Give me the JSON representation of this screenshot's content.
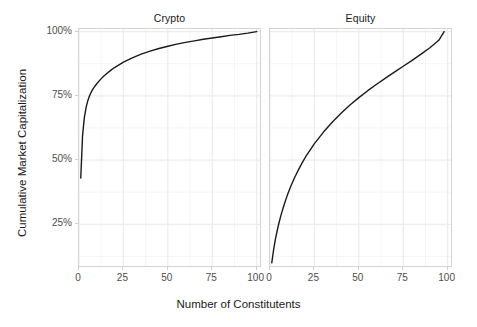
{
  "figure": {
    "width": 477,
    "height": 327,
    "background": "#ffffff",
    "line_color": "#1a1a1a",
    "grid_color": "#f2f2f2",
    "panel_border_color": "#d4d4d4",
    "tick_text_color": "#4d4d4d",
    "axis_title_color": "#1a1a1a"
  },
  "axes": {
    "x_title": "Number of Constitutents",
    "y_title": "Cumulative Market Capitalization",
    "x_ticks": [
      "0",
      "25",
      "50",
      "75",
      "100"
    ],
    "y_ticks": [
      "25%",
      "50%",
      "75%",
      "100%"
    ]
  },
  "panels": [
    {
      "id": "crypto",
      "title": "Crypto"
    },
    {
      "id": "equity",
      "title": "Equity"
    }
  ],
  "chart_data": [
    {
      "type": "line",
      "title": "Crypto",
      "xlabel": "Number of Constitutents",
      "ylabel": "Cumulative Market Capitalization",
      "xlim": [
        0,
        103
      ],
      "ylim": [
        8,
        101
      ],
      "grid": true,
      "legend": "none",
      "x": [
        1,
        2,
        3,
        4,
        5,
        6,
        7,
        8,
        9,
        10,
        12,
        14,
        16,
        18,
        20,
        25,
        30,
        35,
        40,
        45,
        50,
        55,
        60,
        65,
        70,
        75,
        80,
        85,
        90,
        95,
        100
      ],
      "y": [
        43.0,
        59.5,
        66.5,
        70.5,
        73.2,
        75.1,
        76.6,
        77.8,
        78.8,
        79.7,
        81.3,
        82.7,
        83.9,
        85.0,
        86.0,
        88.1,
        89.8,
        91.2,
        92.4,
        93.4,
        94.3,
        95.1,
        95.8,
        96.4,
        97.0,
        97.5,
        98.0,
        98.5,
        98.9,
        99.4,
        100.0
      ],
      "x_ticks": [
        0,
        25,
        50,
        75,
        100
      ],
      "y_ticks": [
        25,
        50,
        75,
        100
      ],
      "y_tick_labels": [
        "25%",
        "50%",
        "75%",
        "100%"
      ]
    },
    {
      "type": "line",
      "title": "Equity",
      "xlabel": "Number of Constitutents",
      "ylabel": "Cumulative Market Capitalization",
      "xlim": [
        0,
        103
      ],
      "ylim": [
        8,
        101
      ],
      "grid": true,
      "legend": "none",
      "x": [
        1,
        2,
        3,
        4,
        5,
        6,
        7,
        8,
        9,
        10,
        12,
        14,
        16,
        18,
        20,
        25,
        30,
        35,
        40,
        45,
        50,
        55,
        60,
        65,
        70,
        75,
        80,
        85,
        90,
        95,
        98
      ],
      "y": [
        10.0,
        15.0,
        19.0,
        22.4,
        25.4,
        28.1,
        30.5,
        32.7,
        34.8,
        36.8,
        40.3,
        43.4,
        46.2,
        48.8,
        51.2,
        56.4,
        60.8,
        64.7,
        68.2,
        71.4,
        74.3,
        77.0,
        79.5,
        81.9,
        84.2,
        86.5,
        88.8,
        91.2,
        93.7,
        96.6,
        100.0
      ],
      "x_ticks": [
        0,
        25,
        50,
        75,
        100
      ],
      "y_ticks": [
        25,
        50,
        75,
        100
      ],
      "y_tick_labels": [
        "25%",
        "50%",
        "75%",
        "100%"
      ]
    }
  ]
}
